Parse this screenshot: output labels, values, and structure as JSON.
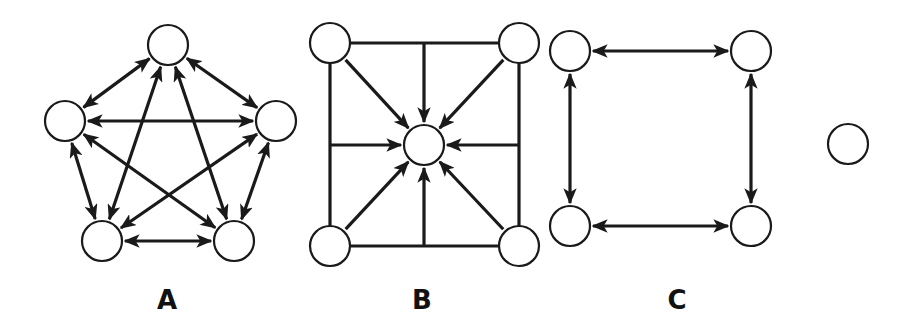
{
  "colors": {
    "stroke": "#1a1a1a",
    "background": "#ffffff",
    "node_fill": "#ffffff"
  },
  "diagrams": [
    {
      "id": "A",
      "label": "A",
      "label_pos": [
        167,
        300
      ],
      "description": "Complete graph of 5 nodes arranged in a pentagon; every pair connected by a bidirectional arrow",
      "nodes": [
        {
          "id": "A1",
          "x": 168,
          "y": 45
        },
        {
          "id": "A2",
          "x": 65,
          "y": 121
        },
        {
          "id": "A3",
          "x": 276,
          "y": 121
        },
        {
          "id": "A4",
          "x": 102,
          "y": 241
        },
        {
          "id": "A5",
          "x": 234,
          "y": 241
        }
      ],
      "edges": [
        {
          "from": "A1",
          "to": "A2",
          "dir": "both"
        },
        {
          "from": "A1",
          "to": "A3",
          "dir": "both"
        },
        {
          "from": "A1",
          "to": "A4",
          "dir": "both"
        },
        {
          "from": "A1",
          "to": "A5",
          "dir": "both"
        },
        {
          "from": "A2",
          "to": "A3",
          "dir": "both"
        },
        {
          "from": "A2",
          "to": "A4",
          "dir": "both"
        },
        {
          "from": "A2",
          "to": "A5",
          "dir": "both"
        },
        {
          "from": "A3",
          "to": "A4",
          "dir": "both"
        },
        {
          "from": "A3",
          "to": "A5",
          "dir": "both"
        },
        {
          "from": "A4",
          "to": "A5",
          "dir": "both"
        }
      ]
    },
    {
      "id": "B",
      "label": "B",
      "label_pos": [
        422,
        300
      ],
      "description": "Square frame of plain lines with 4 corner nodes; arrows from corners and side midpoints all point inward to a central node",
      "nodes": [
        {
          "id": "B1",
          "x": 330,
          "y": 43
        },
        {
          "id": "B2",
          "x": 519,
          "y": 43
        },
        {
          "id": "B3",
          "x": 424,
          "y": 145
        },
        {
          "id": "B4",
          "x": 330,
          "y": 246
        },
        {
          "id": "B5",
          "x": 519,
          "y": 246
        }
      ],
      "frame_lines": [
        {
          "from": "B1",
          "to": "B2"
        },
        {
          "from": "B2",
          "to": "B5"
        },
        {
          "from": "B5",
          "to": "B4"
        },
        {
          "from": "B4",
          "to": "B1"
        }
      ],
      "edges": [
        {
          "from": "B1",
          "to": "B3",
          "dir": "forward"
        },
        {
          "from": "B2",
          "to": "B3",
          "dir": "forward"
        },
        {
          "from": "B4",
          "to": "B3",
          "dir": "forward"
        },
        {
          "from": "B5",
          "to": "B3",
          "dir": "forward"
        },
        {
          "from_point": [
            424,
            43
          ],
          "to": "B3",
          "dir": "forward"
        },
        {
          "from_point": [
            424,
            246
          ],
          "to": "B3",
          "dir": "forward"
        },
        {
          "from_point": [
            330,
            145
          ],
          "to": "B3",
          "dir": "forward"
        },
        {
          "from_point": [
            519,
            145
          ],
          "to": "B3",
          "dir": "forward"
        }
      ]
    },
    {
      "id": "C",
      "label": "C",
      "label_pos": [
        677,
        300
      ],
      "description": "Four nodes in a square connected cyclically by bidirectional arrows, plus one isolated node",
      "nodes": [
        {
          "id": "C1",
          "x": 570,
          "y": 51
        },
        {
          "id": "C2",
          "x": 751,
          "y": 51
        },
        {
          "id": "C3",
          "x": 570,
          "y": 226
        },
        {
          "id": "C4",
          "x": 751,
          "y": 226
        },
        {
          "id": "C5",
          "x": 848,
          "y": 144
        }
      ],
      "edges": [
        {
          "from": "C1",
          "to": "C2",
          "dir": "both"
        },
        {
          "from": "C2",
          "to": "C4",
          "dir": "both"
        },
        {
          "from": "C4",
          "to": "C3",
          "dir": "both"
        },
        {
          "from": "C3",
          "to": "C1",
          "dir": "both"
        }
      ]
    }
  ],
  "node_radius": 20
}
